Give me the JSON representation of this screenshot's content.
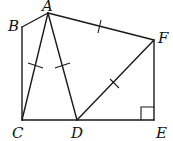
{
  "diagram": {
    "type": "geometry",
    "points": {
      "A": {
        "label": "A",
        "x": 48,
        "y": 13
      },
      "B": {
        "label": "B",
        "x": 22,
        "y": 27
      },
      "C": {
        "label": "C",
        "x": 22,
        "y": 120
      },
      "D": {
        "label": "D",
        "x": 77,
        "y": 120
      },
      "E": {
        "label": "E",
        "x": 154,
        "y": 120
      },
      "F": {
        "label": "F",
        "x": 154,
        "y": 40
      }
    },
    "segments": [
      "AB",
      "BC",
      "CE",
      "EF",
      "FA",
      "AC",
      "AD",
      "DF"
    ],
    "equal_marks": [
      "AC",
      "AD",
      "AF",
      "DF"
    ],
    "right_angle": "E"
  }
}
